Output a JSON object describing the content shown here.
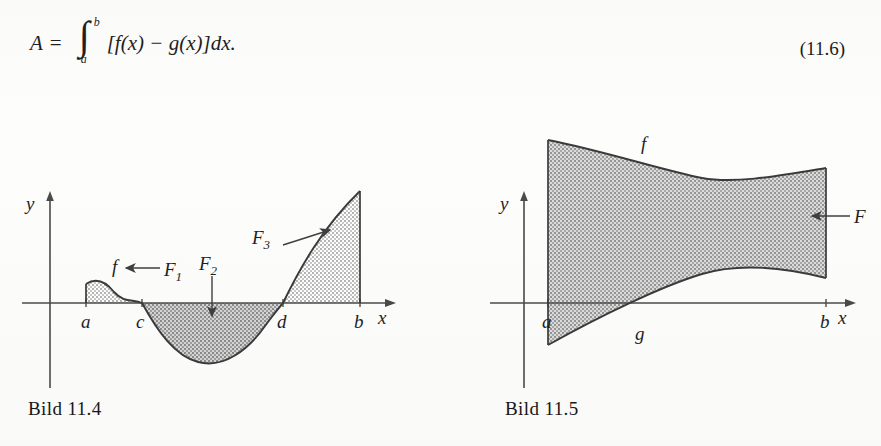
{
  "formula": {
    "lhs": "A",
    "equals": "=",
    "integral_sign": "∫",
    "upper_limit": "b",
    "lower_limit": "a",
    "integrand": "[f(x) − g(x)]dx.",
    "equation_number": "(11.6)"
  },
  "figures": [
    {
      "id": "bild-11-4",
      "caption": "Bild 11.4",
      "axis_labels": {
        "y": "y",
        "x": "x"
      },
      "tick_labels": [
        "a",
        "c",
        "d",
        "b"
      ],
      "curve_labels": [
        "f"
      ],
      "region_labels": [
        "F_1",
        "F_2",
        "F_3"
      ],
      "region_labels_display": [
        "F",
        "F",
        "F"
      ],
      "region_subscripts": [
        "1",
        "2",
        "3"
      ]
    },
    {
      "id": "bild-11-5",
      "caption": "Bild 11.5",
      "axis_labels": {
        "y": "y",
        "x": "x"
      },
      "tick_labels": [
        "a",
        "b"
      ],
      "curve_labels": [
        "f",
        "g"
      ],
      "region_labels": [
        "F"
      ]
    }
  ],
  "colors": {
    "ink": "#1f1f1f",
    "axis": "#4a4a4a",
    "curve": "#3a3a3a",
    "shade_light": "#c9c9c9",
    "shade_dark": "#9a9a9a",
    "paper": "#fdfdfc"
  }
}
